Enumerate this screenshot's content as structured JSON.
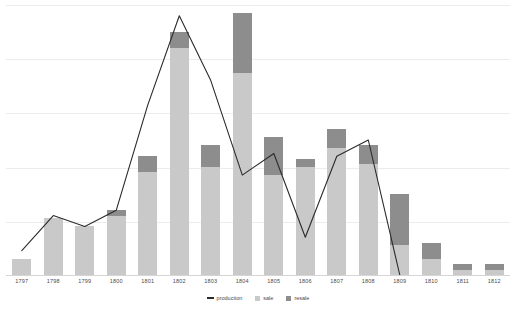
{
  "chart_data": {
    "type": "bar",
    "title": "",
    "subtitle": "",
    "xlabel": "",
    "ylabel": "",
    "grid": true,
    "gridline_count": 5,
    "ylim": [
      0,
      100
    ],
    "legend_position": "bottom-center",
    "categories": [
      "1797",
      "1798",
      "1799",
      "1800",
      "1801",
      "1802",
      "1803",
      "1804",
      "1805",
      "1806",
      "1807",
      "1808",
      "1809",
      "1810",
      "1811",
      "1812"
    ],
    "series": [
      {
        "name": "sale",
        "type": "bar-stack",
        "color": "#c9c9c9",
        "values": [
          6,
          21,
          18,
          22,
          38,
          84,
          40,
          75,
          37,
          40,
          47,
          41,
          11,
          6,
          2,
          2
        ]
      },
      {
        "name": "resale",
        "type": "bar-stack",
        "color": "#8d8d8d",
        "values": [
          0,
          0,
          0,
          2,
          6,
          6,
          8,
          22,
          14,
          3,
          7,
          7,
          19,
          6,
          2,
          2
        ]
      },
      {
        "name": "production",
        "type": "line",
        "color": "#2b2b2b",
        "values": [
          9,
          22,
          18,
          24,
          63,
          96,
          72,
          37,
          45,
          14,
          44,
          50,
          0,
          null,
          null,
          null
        ]
      }
    ]
  },
  "legend": {
    "items": [
      {
        "label": "production",
        "marker": "line-marker",
        "color": "#2b2b2b"
      },
      {
        "label": "sale",
        "marker": "square-marker",
        "color": "#c9c9c9"
      },
      {
        "label": "resale",
        "marker": "square-marker",
        "color": "#8d8d8d"
      }
    ]
  },
  "axis": {
    "x_tick_labels": [
      "1797",
      "1798",
      "1799",
      "1800",
      "1801",
      "1802",
      "1803",
      "1804",
      "1805",
      "1806",
      "1807",
      "1808",
      "1809",
      "1810",
      "1811",
      "1812"
    ]
  },
  "colors": {
    "sale": "#c9c9c9",
    "resale": "#8d8d8d",
    "production": "#2b2b2b",
    "gridline": "#ececec",
    "axis": "#d5d5d5",
    "label_text": "#4a4a4a",
    "background": "#ffffff"
  }
}
